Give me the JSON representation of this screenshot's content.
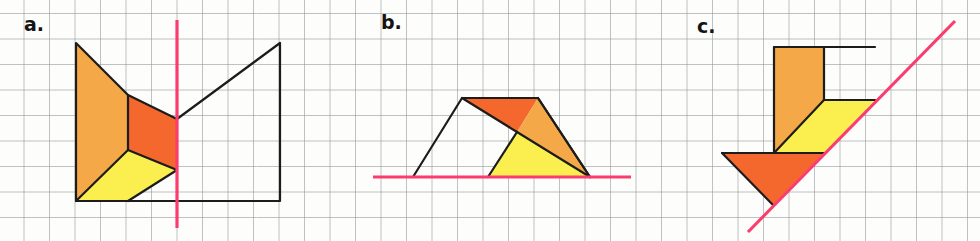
{
  "worksheet": {
    "title": "Symmetry and reflection worksheet — three grid figures",
    "width": 980,
    "height": 241,
    "background_color": "#fdfdfb"
  },
  "grid": {
    "name": "graph-paper-grid",
    "cell_size": 25.5,
    "line_color": "#8e9298",
    "line_width": 0.9,
    "origin_x": -1.5,
    "origin_y": -12.0
  },
  "palette": {
    "orange": "#F5A848",
    "red_orange": "#F4682E",
    "yellow": "#FAEF4E",
    "outline": "#1c1c1c",
    "mirror_line": "#FA3C6E",
    "label_text": "#141414"
  },
  "panels": [
    {
      "id": "a",
      "label": "a.",
      "label_position": {
        "x": 24,
        "y": 15
      },
      "mirror_line": {
        "type": "vertical",
        "x1": 177,
        "y1": 20,
        "x2": 177,
        "y2": 228,
        "color": "#FA3C6E",
        "width": 3.2
      },
      "shapes": [
        {
          "name": "orange-quadrilateral",
          "fill": "#F5A848",
          "points": "76,43 128,95 128,150 76,201"
        },
        {
          "name": "red-orange-quadrilateral",
          "fill": "#F4682E",
          "points": "128,95 177,119 177,170 128,150"
        },
        {
          "name": "yellow-quadrilateral",
          "fill": "#FAEF4E",
          "points": "128,150 177,170 128,201 76,201"
        }
      ],
      "outlines": [
        {
          "name": "shape-a-outer-boundary",
          "points": "76,43 128,95 177,119 280,43 280,201 76,201",
          "closed": true
        },
        {
          "name": "shape-a-inner-vertical-edge",
          "points": "128,95 128,150",
          "closed": false
        },
        {
          "name": "shape-a-inner-diagonal-edge-upper",
          "points": "128,150 177,170",
          "closed": false
        },
        {
          "name": "shape-a-inner-diagonal-edge-lower",
          "points": "128,150 76,201",
          "closed": false
        },
        {
          "name": "shape-a-inner-diagonal-edge-base",
          "points": "177,170 128,201",
          "closed": false
        }
      ]
    },
    {
      "id": "b",
      "label": "b.",
      "label_position": {
        "x": 381,
        "y": 13
      },
      "mirror_line": {
        "type": "horizontal",
        "x1": 373,
        "y1": 177,
        "x2": 631,
        "y2": 177,
        "color": "#FA3C6E",
        "width": 3.2
      },
      "shapes": [
        {
          "name": "red-orange-triangle",
          "fill": "#F4682E",
          "points": "462,98 538,98 517,132"
        },
        {
          "name": "orange-triangle",
          "fill": "#F5A848",
          "points": "538,98 590,177 517,132"
        },
        {
          "name": "yellow-triangle",
          "fill": "#FAEF4E",
          "points": "517,132 590,177 488,177"
        }
      ],
      "outlines": [
        {
          "name": "shape-b-outer-boundary",
          "points": "413,177 462,98 538,98 590,177",
          "closed": false
        },
        {
          "name": "shape-b-inner-edge-left",
          "points": "462,98 517,132",
          "closed": false
        },
        {
          "name": "shape-b-inner-edge-right",
          "points": "538,98 590,177",
          "closed": false
        },
        {
          "name": "shape-b-inner-edge-down",
          "points": "517,132 488,177",
          "closed": false
        },
        {
          "name": "shape-b-inner-edge-diagonal",
          "points": "517,132 590,177",
          "closed": false
        }
      ]
    },
    {
      "id": "c",
      "label": "c.",
      "label_position": {
        "x": 697,
        "y": 17
      },
      "mirror_line": {
        "type": "diagonal",
        "x1": 748,
        "y1": 232,
        "x2": 955,
        "y2": 21,
        "color": "#FA3C6E",
        "width": 3.2
      },
      "shapes": [
        {
          "name": "orange-arrow-shaft",
          "fill": "#F5A848",
          "points": "774,47 824,47 824,100 774,153"
        },
        {
          "name": "orange-arrow-shaft-lower",
          "fill": "#F5A848",
          "points": "774,47 774,153 774,153"
        },
        {
          "name": "yellow-arrow-wing",
          "fill": "#FAEF4E",
          "points": "824,100 875,100 824,153 774,153"
        },
        {
          "name": "red-orange-arrow-head",
          "fill": "#F4682E",
          "points": "722,153 824,153 773,205"
        }
      ],
      "outlines": [
        {
          "name": "shape-c-shaft-left-edge",
          "points": "774,47 774,153",
          "closed": false
        },
        {
          "name": "shape-c-top-edge",
          "points": "774,47 875,47",
          "closed": false
        },
        {
          "name": "shape-c-shaft-right-edge",
          "points": "824,47 824,100",
          "closed": false
        },
        {
          "name": "shape-c-wing-top-edge",
          "points": "824,100 875,100",
          "closed": false
        },
        {
          "name": "shape-c-wing-diagonal",
          "points": "824,100 774,153",
          "closed": false
        },
        {
          "name": "shape-c-head-top-edge",
          "points": "722,153 824,153",
          "closed": false
        },
        {
          "name": "shape-c-head-left-edge",
          "points": "722,153 773,205",
          "closed": false
        }
      ]
    }
  ]
}
